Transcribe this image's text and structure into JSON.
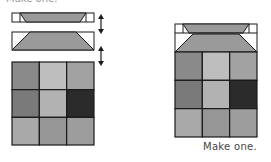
{
  "header": {
    "partial_text": "Make one."
  },
  "caption": "Make one.",
  "colors": {
    "outline": "#1a1a1a",
    "trapezoid": "#9a9a9a",
    "white": "#ffffff"
  },
  "exploded_view": {
    "strip_thin": {
      "label": "top thin flying-geese strip"
    },
    "strip_tall": {
      "label": "flying-geese strip"
    },
    "arrows": [
      "up-down-arrow",
      "up-down-arrow"
    ],
    "grid": {
      "rows": 3,
      "cols": 3,
      "cells": [
        [
          "#8a8a8a",
          "#bebebe",
          "#a2a2a2"
        ],
        [
          "#7a7a7a",
          "#b2b2b2",
          "#2b2b2b"
        ],
        [
          "#a9a9a9",
          "#969696",
          "#9d9d9d"
        ]
      ]
    }
  },
  "assembled_view": {
    "grid": {
      "rows": 3,
      "cols": 3,
      "cells": [
        [
          "#8a8a8a",
          "#bebebe",
          "#a2a2a2"
        ],
        [
          "#7a7a7a",
          "#b2b2b2",
          "#2b2b2b"
        ],
        [
          "#a9a9a9",
          "#969696",
          "#9d9d9d"
        ]
      ]
    }
  }
}
